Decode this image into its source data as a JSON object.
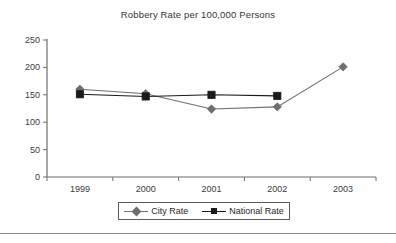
{
  "chart_data": {
    "type": "line",
    "title": "Robbery Rate per 100,000 Persons",
    "xlabel": "",
    "ylabel": "",
    "categories": [
      "1999",
      "2000",
      "2001",
      "2002",
      "2003"
    ],
    "series": [
      {
        "name": "City Rate",
        "marker": "diamond",
        "color": "#6e6e6e",
        "values": [
          160,
          152,
          124,
          128,
          201
        ]
      },
      {
        "name": "National Rate",
        "marker": "square",
        "color": "#1a1a1a",
        "values": [
          151,
          147,
          150,
          148,
          null
        ]
      }
    ],
    "ylim": [
      0,
      250
    ],
    "yticks": [
      0,
      50,
      100,
      150,
      200,
      250
    ],
    "ytick_labels": [
      "0",
      "50",
      "100",
      "150",
      "200",
      "250"
    ],
    "grid": false,
    "legend_position": "bottom"
  },
  "legend": {
    "entries": [
      {
        "label": "City Rate",
        "marker": "diamond-marker",
        "color": "#6e6e6e"
      },
      {
        "label": "National Rate",
        "marker": "square-marker",
        "color": "#1a1a1a"
      }
    ]
  },
  "axis": {
    "line_color": "#6f6f6f",
    "tick_color": "#6f6f6f"
  }
}
